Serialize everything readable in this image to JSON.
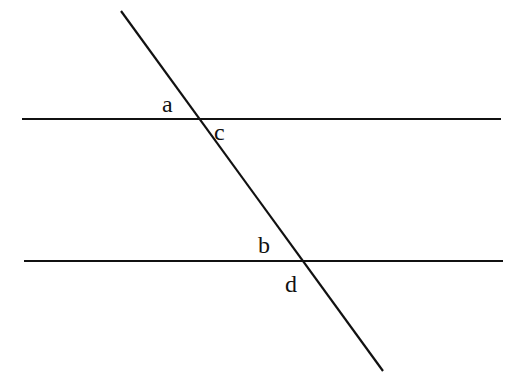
{
  "diagram": {
    "type": "parallel-lines-cut-by-transversal",
    "colors": {
      "line": "#111111",
      "background": "#ffffff"
    },
    "lines": {
      "top_parallel": {
        "x1": 22,
        "y1": 119,
        "x2": 501,
        "y2": 119
      },
      "bottom_parallel": {
        "x1": 24,
        "y1": 261,
        "x2": 503,
        "y2": 261
      },
      "transversal": {
        "x1": 121,
        "y1": 11,
        "x2": 383,
        "y2": 371
      }
    },
    "angle_labels": [
      {
        "id": "a",
        "text": "a",
        "x": 162,
        "y": 112,
        "position": "above-left of top intersection"
      },
      {
        "id": "c",
        "text": "c",
        "x": 214,
        "y": 140,
        "position": "below-right of top intersection"
      },
      {
        "id": "b",
        "text": "b",
        "x": 258,
        "y": 253,
        "position": "above-left of bottom intersection"
      },
      {
        "id": "d",
        "text": "d",
        "x": 285,
        "y": 292,
        "position": "below-left of bottom intersection"
      }
    ]
  }
}
